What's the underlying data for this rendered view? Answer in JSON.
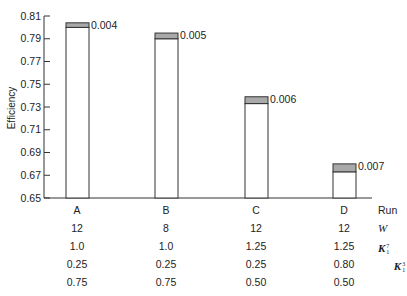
{
  "chart_data": {
    "type": "bar",
    "title": "",
    "xlabel": "Run",
    "ylabel": "Efficiency",
    "ylim": [
      0.65,
      0.81
    ],
    "yticks": [
      0.65,
      0.67,
      0.69,
      0.71,
      0.73,
      0.75,
      0.77,
      0.79,
      0.81
    ],
    "ytick_labels": [
      "0.65",
      "0.67",
      "0.69",
      "0.71",
      "0.73",
      "0.75",
      "0.77",
      "0.79",
      "0.81"
    ],
    "grid": false,
    "legend": null,
    "categories": [
      "A",
      "B",
      "C",
      "D"
    ],
    "series": [
      {
        "name": "Efficiency (base, white)",
        "values": [
          0.8,
          0.79,
          0.733,
          0.673
        ]
      },
      {
        "name": "Uncertainty band (shaded)",
        "values": [
          0.004,
          0.005,
          0.006,
          0.007
        ]
      }
    ],
    "annotations": [
      "0.004",
      "0.005",
      "0.006",
      "0.007"
    ],
    "table": {
      "row_headers": [
        "Run",
        "W",
        "K1^7",
        "K1^3",
        "K1^1"
      ],
      "rows": [
        {
          "label": "Run",
          "values": [
            "A",
            "B",
            "C",
            "D"
          ]
        },
        {
          "label": "W",
          "values": [
            "12",
            "8",
            "12",
            "12"
          ]
        },
        {
          "label": "K1^7",
          "values": [
            "1.0",
            "1.0",
            "1.25",
            "1.25"
          ]
        },
        {
          "label": "K1^3",
          "values": [
            "0.25",
            "0.25",
            "0.25",
            "0.80"
          ]
        },
        {
          "label": "K1^1",
          "values": [
            "0.75",
            "0.75",
            "0.50",
            "0.50"
          ]
        }
      ]
    }
  },
  "colors": {
    "bar_fill": "#ffffff",
    "band_fill": "#a9a9a9",
    "stroke": "#333333"
  },
  "labels": {
    "y_axis": "Efficiency",
    "run": "Run",
    "w": "W",
    "k": "K",
    "k7_sup": "7",
    "k7_sub": "1",
    "k3_sup": "3",
    "k3_sub": "1",
    "k1_sup": "1",
    "k1_sub": "1"
  }
}
